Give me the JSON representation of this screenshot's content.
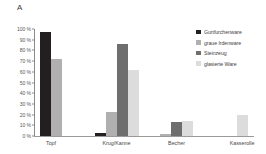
{
  "panel": {
    "label": "A"
  },
  "chart_data": {
    "type": "bar",
    "title": "",
    "subtitle": "",
    "xlabel": "",
    "ylabel": "",
    "ylim": [
      0,
      100
    ],
    "grid": false,
    "legend_position": "right",
    "value_suffix": "%",
    "categories": [
      "Topf",
      "Krug/Kanne",
      "Becher",
      "Kasserolle"
    ],
    "ytick_labels": [
      "0 %",
      "10 %",
      "20 %",
      "30 %",
      "40 %",
      "50 %",
      "60 %",
      "70 %",
      "80 %",
      "90 %",
      "100 %"
    ],
    "ytick_values": [
      0,
      10,
      20,
      30,
      40,
      50,
      60,
      70,
      80,
      90,
      100
    ],
    "series": [
      {
        "name": "Gurtfurchenware",
        "color": "#231f20",
        "values": [
          97,
          3,
          0,
          0
        ]
      },
      {
        "name": "graue Irdenware",
        "color": "#b0b0b0",
        "values": [
          72,
          22,
          2,
          0
        ]
      },
      {
        "name": "Steinzeug",
        "color": "#6e6e6e",
        "values": [
          0,
          86,
          13.5,
          0
        ]
      },
      {
        "name": "glasierte Ware",
        "color": "#dcdcdc",
        "values": [
          0,
          62,
          14,
          20
        ]
      }
    ]
  },
  "legend": {
    "items": [
      {
        "label": "Gurtfurchenware",
        "color": "#231f20"
      },
      {
        "label": "graue Irdenware",
        "color": "#b0b0b0"
      },
      {
        "label": "Steinzeug",
        "color": "#6e6e6e"
      },
      {
        "label": "glasierte Ware",
        "color": "#dcdcdc"
      }
    ]
  },
  "axis": {
    "y_line_color": "#8a8a8a",
    "x_line_color": "#9a9a9a"
  }
}
